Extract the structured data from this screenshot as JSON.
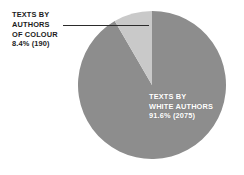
{
  "chart_data": {
    "type": "pie",
    "title": "",
    "subtitle": "",
    "xlabel": "",
    "ylabel": "",
    "grid": false,
    "legend_position": "none",
    "start_angle_deg": 90,
    "direction": "counterclockwise",
    "total_count": 2265,
    "categories": [
      "TEXTS BY WHITE AUTHORS",
      "TEXTS BY AUTHORS OF COLOUR"
    ],
    "values": [
      91.6,
      8.4
    ],
    "counts": [
      2075,
      190
    ],
    "slices": [
      {
        "name": "TEXTS BY WHITE AUTHORS",
        "percent": 91.6,
        "percent_label": "91.6%",
        "count": 2075,
        "count_label": "(2075)",
        "color": "#8d8d8d",
        "label_placement": "inside",
        "label_color": "#ffffff"
      },
      {
        "name": "TEXTS BY AUTHORS OF COLOUR",
        "percent": 8.4,
        "percent_label": "8.4%",
        "count": 190,
        "count_label": "(190)",
        "color": "#c9c9c9",
        "label_placement": "callout-left",
        "label_color": "#1c1c1c"
      }
    ],
    "annotations": [
      {
        "name": "leader-line",
        "from": "callout-label",
        "to": "small-slice"
      }
    ]
  },
  "labels": {
    "white_authors": {
      "line1": "TEXTS BY",
      "line2": "WHITE AUTHORS",
      "line3": "91.6% (2075)"
    },
    "authors_of_colour": {
      "line1": "TEXTS BY",
      "line2": "AUTHORS",
      "line3": "OF COLOUR",
      "line4": "8.4% (190)"
    }
  },
  "colors": {
    "background": "#ffffff",
    "slice_major": "#8d8d8d",
    "slice_minor": "#c9c9c9",
    "leader_line": "#2b2b2b",
    "text_dark": "#1c1c1c",
    "text_light": "#ffffff"
  }
}
